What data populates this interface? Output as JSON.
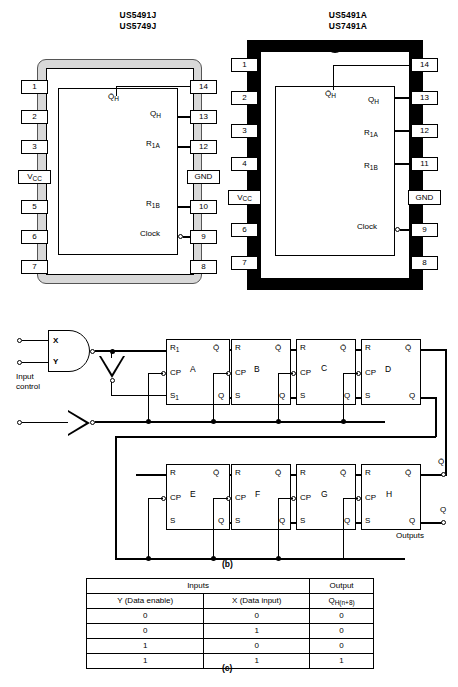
{
  "figure": {
    "captions": {
      "logic": "(b)",
      "truth_table": "(c)"
    }
  },
  "packages": [
    {
      "id": "j-package",
      "titles": [
        "US5491J",
        "US5749J"
      ],
      "style": "ceramic-shaded",
      "left_pins": [
        "1",
        "2",
        "3",
        "V<sub>CC</sub>",
        "5",
        "6",
        "7"
      ],
      "right_pins": [
        "14",
        "13",
        "12",
        "GND",
        "10",
        "9",
        "8"
      ],
      "signals": [
        {
          "name": "qh-bar",
          "label": "Q̄<sub>H</sub>",
          "pin": "14"
        },
        {
          "name": "qh",
          "label": "Q<sub>H</sub>",
          "pin": "13"
        },
        {
          "name": "r1a",
          "label": "R<sub>1A</sub>",
          "pin": "12"
        },
        {
          "name": "r1b",
          "label": "R<sub>1B</sub>",
          "pin": "10"
        },
        {
          "name": "clock",
          "label": "Clock",
          "pin": "9"
        }
      ]
    },
    {
      "id": "a-package",
      "titles": [
        "US5491A",
        "US7491A"
      ],
      "style": "plastic-black",
      "left_pins": [
        "1",
        "2",
        "3",
        "4",
        "V<sub>CC</sub>",
        "6",
        "7"
      ],
      "right_pins": [
        "14",
        "13",
        "12",
        "11",
        "GND",
        "9",
        "8"
      ],
      "signals": [
        {
          "name": "qh-bar",
          "label": "Q̄<sub>H</sub>",
          "pin": "14"
        },
        {
          "name": "qh",
          "label": "Q<sub>H</sub>",
          "pin": "13"
        },
        {
          "name": "r1a",
          "label": "R<sub>1A</sub>",
          "pin": "12"
        },
        {
          "name": "r1b",
          "label": "R<sub>1B</sub>",
          "pin": "11"
        },
        {
          "name": "clock",
          "label": "Clock",
          "pin": "9"
        }
      ]
    }
  ],
  "logic_diagram": {
    "gate": {
      "type": "nand",
      "input_x": "X",
      "input_y": "Y"
    },
    "input_control_label": "Input\ncontrol",
    "flipflops_top": [
      {
        "id": "A",
        "r": "R<sub>1</sub>",
        "s": "S<sub>1</sub>",
        "cp": "CP",
        "q": "Q",
        "qbar": "Q̄"
      },
      {
        "id": "B",
        "r": "R",
        "s": "S",
        "cp": "CP",
        "q": "Q",
        "qbar": "Q̄"
      },
      {
        "id": "C",
        "r": "R",
        "s": "S",
        "cp": "CP",
        "q": "Q",
        "qbar": "Q̄"
      },
      {
        "id": "D",
        "r": "R",
        "s": "S",
        "cp": "CP",
        "q": "Q",
        "qbar": "Q̄"
      }
    ],
    "flipflops_bottom": [
      {
        "id": "E",
        "r": "R",
        "s": "S",
        "cp": "CP",
        "q": "Q",
        "qbar": "Q̄"
      },
      {
        "id": "F",
        "r": "R",
        "s": "S",
        "cp": "CP",
        "q": "Q",
        "qbar": "Q̄"
      },
      {
        "id": "G",
        "r": "R",
        "s": "S",
        "cp": "CP",
        "q": "Q",
        "qbar": "Q̄"
      },
      {
        "id": "H",
        "r": "R",
        "s": "S",
        "cp": "CP",
        "q": "Q",
        "qbar": "Q̄"
      }
    ],
    "outputs": {
      "qbar": "Q̄",
      "q": "Q",
      "label": "Outputs"
    }
  },
  "truth_table": {
    "group_headers": [
      "Inputs",
      "Output"
    ],
    "columns": [
      "Y (Data enable)",
      "X (Data input)",
      "Q<sub>H(n+8)</sub>"
    ],
    "rows": [
      [
        "0",
        "0",
        "0"
      ],
      [
        "0",
        "1",
        "0"
      ],
      [
        "1",
        "0",
        "0"
      ],
      [
        "1",
        "1",
        "1"
      ]
    ]
  }
}
